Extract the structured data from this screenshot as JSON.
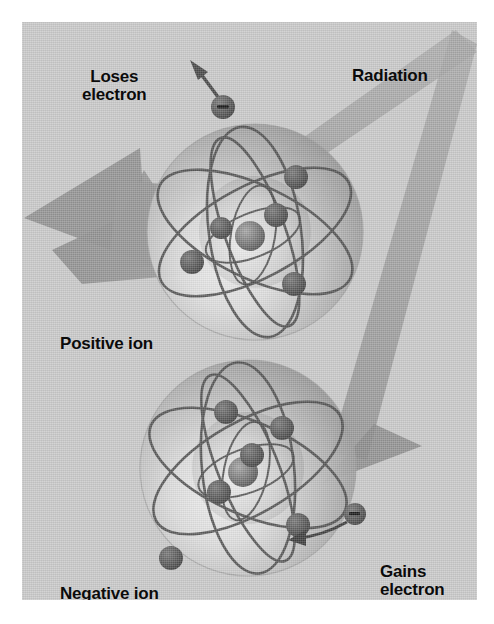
{
  "figure": {
    "panel": {
      "background_color": "#c9c9c9",
      "border_color": "#ffffff"
    }
  },
  "labels": {
    "loses_electron": "Loses\nelectron",
    "radiation": "Radiation",
    "positive_ion": "Positive ion",
    "negative_ion": "Negative ion",
    "gains_electron": "Gains\nelectron"
  },
  "colors": {
    "panel": "#c9c9c9",
    "beam": "#9a9a9a",
    "beam_dark": "#8a8a8a",
    "arrow": "#8f8f8f",
    "electron": "#5a5a5a",
    "electron_dark": "#4a4a4a",
    "orbit_line": "#4f4f4f",
    "sphere_light": "#e8e8e8",
    "sphere_mid": "#bdbdbd",
    "sphere_dark": "#8d8d8d",
    "nucleus": "#6e6e6e",
    "text": "#0b0b0b"
  },
  "atoms": [
    {
      "name": "positive-ion-atom",
      "role": "Positive ion",
      "center": {
        "x": 255,
        "y": 232
      },
      "radius": 108,
      "nucleus": {
        "x": 249,
        "y": 236,
        "r": 15
      },
      "inner_shell_electrons": [
        {
          "x": 220,
          "y": 228,
          "r": 11
        },
        {
          "x": 276,
          "y": 215,
          "r": 12
        }
      ],
      "outer_shell_electrons": [
        {
          "x": 192,
          "y": 262,
          "r": 12
        },
        {
          "x": 296,
          "y": 177,
          "r": 12
        },
        {
          "x": 294,
          "y": 284,
          "r": 12
        }
      ],
      "orbit_count": 4
    },
    {
      "name": "negative-ion-atom",
      "role": "Negative ion",
      "center": {
        "x": 248,
        "y": 468
      },
      "radius": 108,
      "nucleus": {
        "x": 242,
        "y": 472,
        "r": 15
      },
      "inner_shell_electrons": [
        {
          "x": 251,
          "y": 455,
          "r": 12
        },
        {
          "x": 218,
          "y": 492,
          "r": 12
        }
      ],
      "outer_shell_electrons": [
        {
          "x": 225,
          "y": 412,
          "r": 12
        },
        {
          "x": 281,
          "y": 428,
          "r": 12
        },
        {
          "x": 297,
          "y": 525,
          "r": 12
        },
        {
          "x": 170,
          "y": 558,
          "r": 12
        }
      ],
      "orbit_count": 4
    }
  ],
  "free_electrons": [
    {
      "name": "escaping-electron",
      "x": 223,
      "y": 107,
      "r": 12,
      "charge_symbol": "minus",
      "direction": "up-left",
      "arrow": {
        "from": {
          "x": 219,
          "y": 101
        },
        "to": {
          "x": 197,
          "y": 66
        }
      }
    },
    {
      "name": "captured-electron",
      "x": 355,
      "y": 514,
      "r": 11,
      "charge_symbol": "minus",
      "direction": "into-atom",
      "arrow": {
        "from": {
          "x": 346,
          "y": 520
        },
        "to": {
          "x": 288,
          "y": 533
        }
      }
    }
  ],
  "beams": [
    {
      "name": "radiation-beam-upper",
      "description": "Diagonal radiation beam entering upper atom from top right",
      "from": {
        "x": 455,
        "y": 40
      },
      "to": {
        "x": 120,
        "y": 250
      }
    },
    {
      "name": "radiation-beam-lower",
      "description": "Radiation beam descending on the right into the lower atom",
      "from": {
        "x": 450,
        "y": 45
      },
      "to": {
        "x": 330,
        "y": 470
      }
    }
  ],
  "arrows": [
    {
      "name": "positive-ion-recoil-arrow",
      "description": "Large gray arrow pointing left away from the upper atom",
      "direction": "left",
      "tip": {
        "x": 18,
        "y": 215
      }
    },
    {
      "name": "radiation-impact-arrow",
      "description": "Arrowhead of the lower radiation beam striking the negative ion",
      "direction": "down-left",
      "tip": {
        "x": 333,
        "y": 466
      }
    }
  ]
}
